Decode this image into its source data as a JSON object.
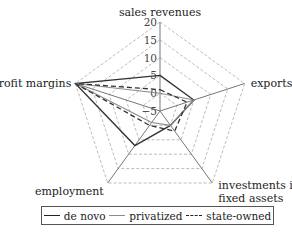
{
  "chart_data": {
    "type": "radar",
    "title": "",
    "axes": [
      "sales revenues",
      "exports",
      "investments in fixed assets",
      "employment",
      "profit margins"
    ],
    "axis_label_lines": {
      "sales revenues": [
        "sales revenues"
      ],
      "exports": [
        "exports"
      ],
      "investments in fixed assets": [
        "investments in",
        "fixed assets"
      ],
      "employment": [
        "employment"
      ],
      "profit margins": [
        "profit margins"
      ]
    },
    "range": [
      -5,
      20
    ],
    "ticks": [
      20,
      15,
      10,
      5,
      0,
      -5
    ],
    "grid": "dashed pentagon",
    "legend_position": "bottom",
    "series": [
      {
        "name": "de novo",
        "style": "solid",
        "color": "#333333",
        "values": [
          5,
          5,
          0,
          7,
          20
        ]
      },
      {
        "name": "privatized",
        "style": "solid",
        "color": "#8a8a8a",
        "values": [
          0,
          5,
          0,
          -1,
          20
        ]
      },
      {
        "name": "state-owned",
        "style": "dashed",
        "color": "#333333",
        "values": [
          1,
          3,
          2,
          0,
          20
        ]
      }
    ]
  },
  "legend": {
    "items": [
      {
        "label": "de novo"
      },
      {
        "label": "privatized"
      },
      {
        "label": "state-owned"
      }
    ]
  }
}
